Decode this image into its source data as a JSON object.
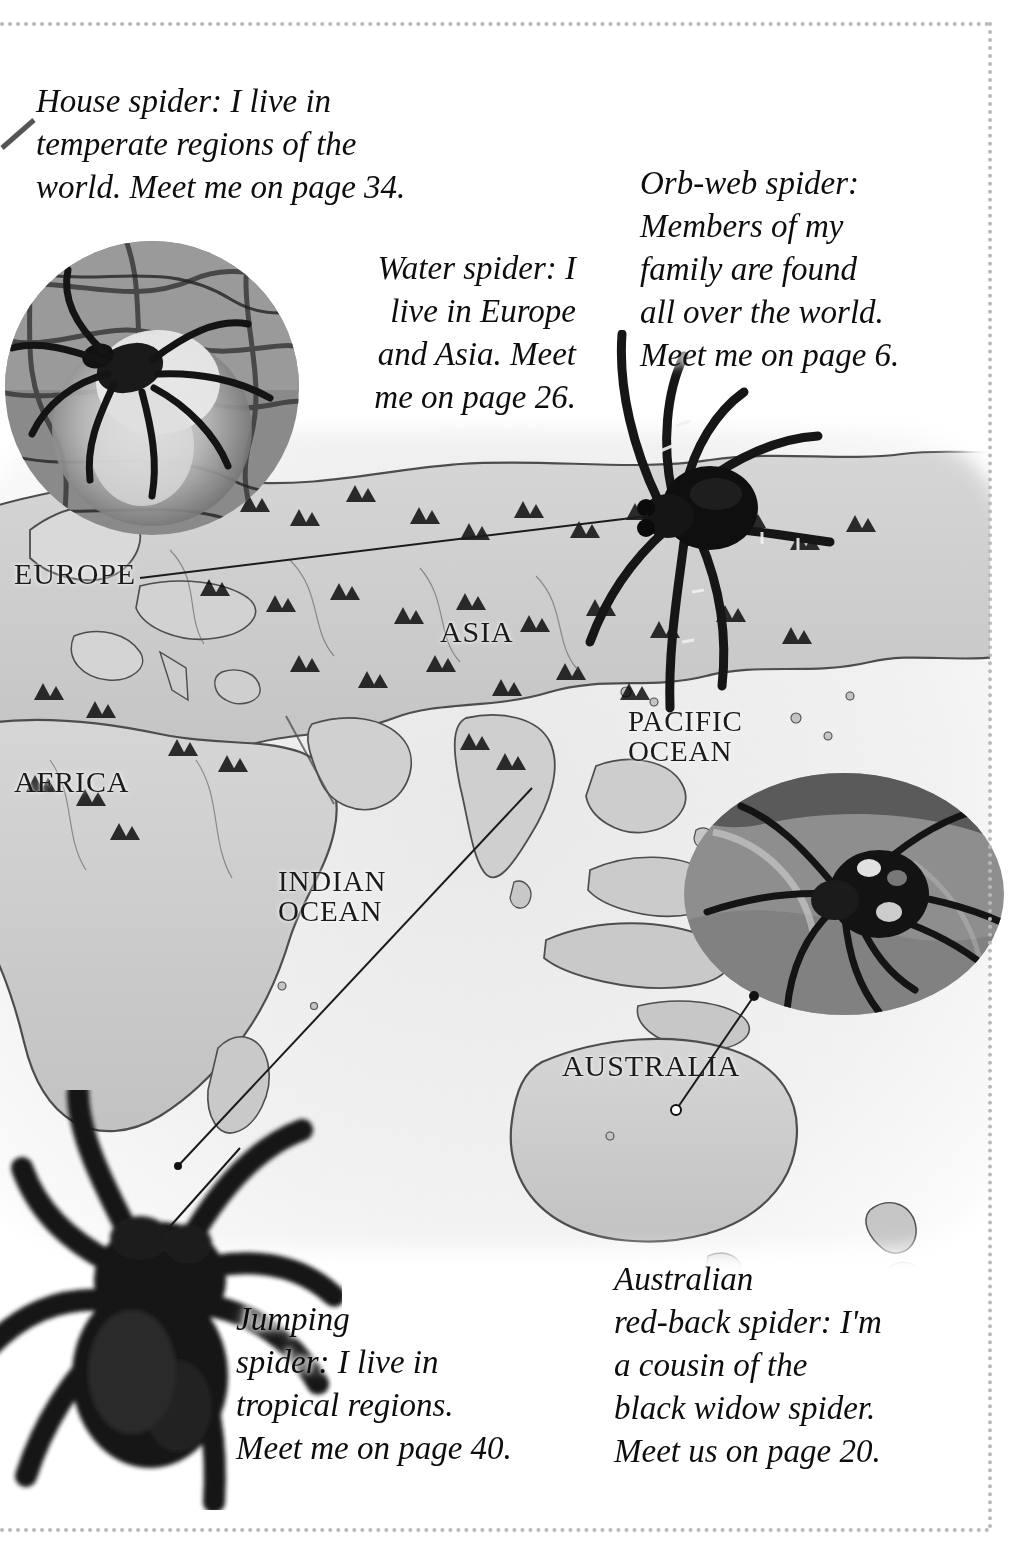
{
  "page": {
    "kind": "illustrated-book-page",
    "border_color": "#b9b9bd",
    "background": "#ffffff",
    "ink_color": "#111111"
  },
  "captions": {
    "house_spider": "House spider: I live in\ntemperate regions of the\nworld. Meet me on page 34.",
    "water_spider": "Water spider: I\nlive in Europe\nand Asia. Meet\nme on page 26.",
    "orb_web_spider": "Orb-web spider:\nMembers of my\nfamily are found\nall over the world.\nMeet me on page 6.",
    "jumping_spider": "Jumping\nspider: I live in\ntropical regions.\nMeet me on page 40.",
    "redback_spider": "Australian\nred-back spider: I'm\na cousin of the\nblack widow spider.\nMeet us on page 20."
  },
  "page_references": {
    "house_spider": "34",
    "water_spider": "26",
    "orb_web_spider": "6",
    "jumping_spider": "40",
    "redback_spider": "20"
  },
  "map": {
    "labels": {
      "europe": "EUROPE",
      "asia": "ASIA",
      "africa": "AFRICA",
      "pacific_ocean": "PACIFIC\nOCEAN",
      "indian_ocean": "INDIAN\nOCEAN",
      "australia": "AUSTRALIA"
    },
    "style": "hand-drawn grayscale relief map with mountain hachures",
    "land_color": "#cfcfcf",
    "sea_color": "#f4f4f4",
    "outline_color": "#4a4a4a"
  },
  "photos": {
    "water_spider": {
      "name": "water-spider-photo",
      "shape": "circle",
      "tone": "grayscale"
    },
    "orb_web_spider": {
      "name": "orb-web-spider-photo",
      "shape": "cutout",
      "tone": "grayscale"
    },
    "redback_spider": {
      "name": "redback-spider-photo",
      "shape": "oval",
      "tone": "grayscale"
    },
    "jumping_spider": {
      "name": "jumping-spider-photo",
      "shape": "cutout",
      "tone": "grayscale"
    }
  },
  "leader_lines": [
    {
      "name": "europe-to-orb-web-spider",
      "from": "EUROPE label",
      "to": "orb-web spider photo"
    },
    {
      "name": "asia-to-jumping-spider",
      "from": "south-east Asia",
      "to": "jumping spider photo"
    },
    {
      "name": "australia-to-redback-photo",
      "from": "Australia",
      "to": "red-back spider photo"
    },
    {
      "name": "house-spider-pointer",
      "from": "House spider caption",
      "to": "top-left margin"
    }
  ]
}
